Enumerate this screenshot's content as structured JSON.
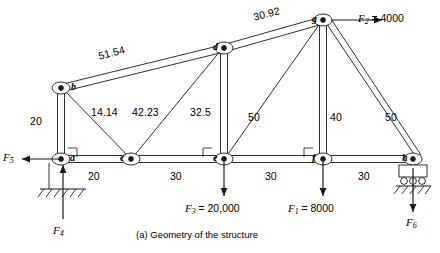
{
  "figure": {
    "caption": "(a) Geometry of the structure",
    "type": "truss-structure-diagram"
  },
  "nodes": [
    {
      "id": "a",
      "label": "a",
      "x": 61,
      "y": 159
    },
    {
      "id": "b",
      "label": "b",
      "x": 61,
      "y": 88
    },
    {
      "id": "c",
      "label": "c",
      "x": 131,
      "y": 159
    },
    {
      "id": "d",
      "label": "d",
      "x": 224,
      "y": 48
    },
    {
      "id": "e",
      "label": "e",
      "x": 224,
      "y": 159
    },
    {
      "id": "f",
      "label": "f",
      "x": 323,
      "y": 159
    },
    {
      "id": "g",
      "label": "g",
      "x": 323,
      "y": 20
    },
    {
      "id": "h",
      "label": "h",
      "x": 413,
      "y": 159
    }
  ],
  "members": [
    {
      "from": "b",
      "to": "d",
      "length_label": "51.54",
      "style": "bar"
    },
    {
      "from": "d",
      "to": "g",
      "length_label": "30.92",
      "style": "bar"
    },
    {
      "from": "a",
      "to": "b",
      "length_label": "20",
      "style": "bar"
    },
    {
      "from": "b",
      "to": "c",
      "length_label": "14.14",
      "style": "line"
    },
    {
      "from": "c",
      "to": "d",
      "length_label": "42.23",
      "style": "line"
    },
    {
      "from": "d",
      "to": "e",
      "length_label": "32.5",
      "style": "bar"
    },
    {
      "from": "e",
      "to": "g",
      "length_label": "50",
      "style": "line"
    },
    {
      "from": "f",
      "to": "g",
      "length_label": "40",
      "style": "bar"
    },
    {
      "from": "g",
      "to": "h",
      "length_label": "50",
      "style": "bar"
    },
    {
      "from": "a",
      "to": "h",
      "length_label": "",
      "style": "bar"
    }
  ],
  "member_labels": [
    {
      "text": "51.54",
      "x": 97,
      "y": 50,
      "rotated": true
    },
    {
      "text": "30.92",
      "x": 252,
      "y": 11,
      "rotated": true
    },
    {
      "text": "20",
      "x": 30,
      "y": 115,
      "rotated": false
    },
    {
      "text": "14.14",
      "x": 91,
      "y": 106,
      "rotated": false
    },
    {
      "text": "42.23",
      "x": 132,
      "y": 106,
      "rotated": false
    },
    {
      "text": "32.5",
      "x": 190,
      "y": 106,
      "rotated": false
    },
    {
      "text": "50",
      "x": 248,
      "y": 111,
      "rotated": false
    },
    {
      "text": "40",
      "x": 330,
      "y": 111,
      "rotated": false
    },
    {
      "text": "50",
      "x": 385,
      "y": 111,
      "rotated": false
    }
  ],
  "dimensions": [
    {
      "text": "20",
      "x": 88,
      "y": 170
    },
    {
      "text": "30",
      "x": 170,
      "y": 170
    },
    {
      "text": "30",
      "x": 265,
      "y": 170
    },
    {
      "text": "30",
      "x": 358,
      "y": 170
    }
  ],
  "forces": [
    {
      "name": "F2",
      "symbol": "F",
      "sub": "2",
      "value": "= 4000",
      "label_x": 358,
      "label_y": 13,
      "direction": "right",
      "at_node": "g"
    },
    {
      "name": "F5",
      "symbol": "F",
      "sub": "5",
      "value": "",
      "label_x": 2,
      "label_y": 152,
      "direction": "left",
      "at_node": "a"
    },
    {
      "name": "F4",
      "symbol": "F",
      "sub": "4",
      "value": "",
      "label_x": 52,
      "label_y": 226,
      "direction": "up",
      "at_node": "a"
    },
    {
      "name": "F3",
      "symbol": "F",
      "sub": "3",
      "value": "= 20,000",
      "label_x": 188,
      "label_y": 203,
      "direction": "down",
      "at_node": "e"
    },
    {
      "name": "F1",
      "symbol": "F",
      "sub": "1",
      "value": "= 8000",
      "label_x": 288,
      "label_y": 203,
      "direction": "down",
      "at_node": "f"
    },
    {
      "name": "F6",
      "symbol": "F",
      "sub": "6",
      "value": "",
      "label_x": 405,
      "label_y": 218,
      "direction": "down",
      "at_node": "h"
    }
  ],
  "supports": [
    {
      "type": "pinned-hatched",
      "at_node": "a"
    },
    {
      "type": "roller-hatched",
      "at_node": "h"
    }
  ],
  "colors": {
    "line": "#1a1a1a",
    "background": "#ffffff",
    "text": "#000000"
  }
}
